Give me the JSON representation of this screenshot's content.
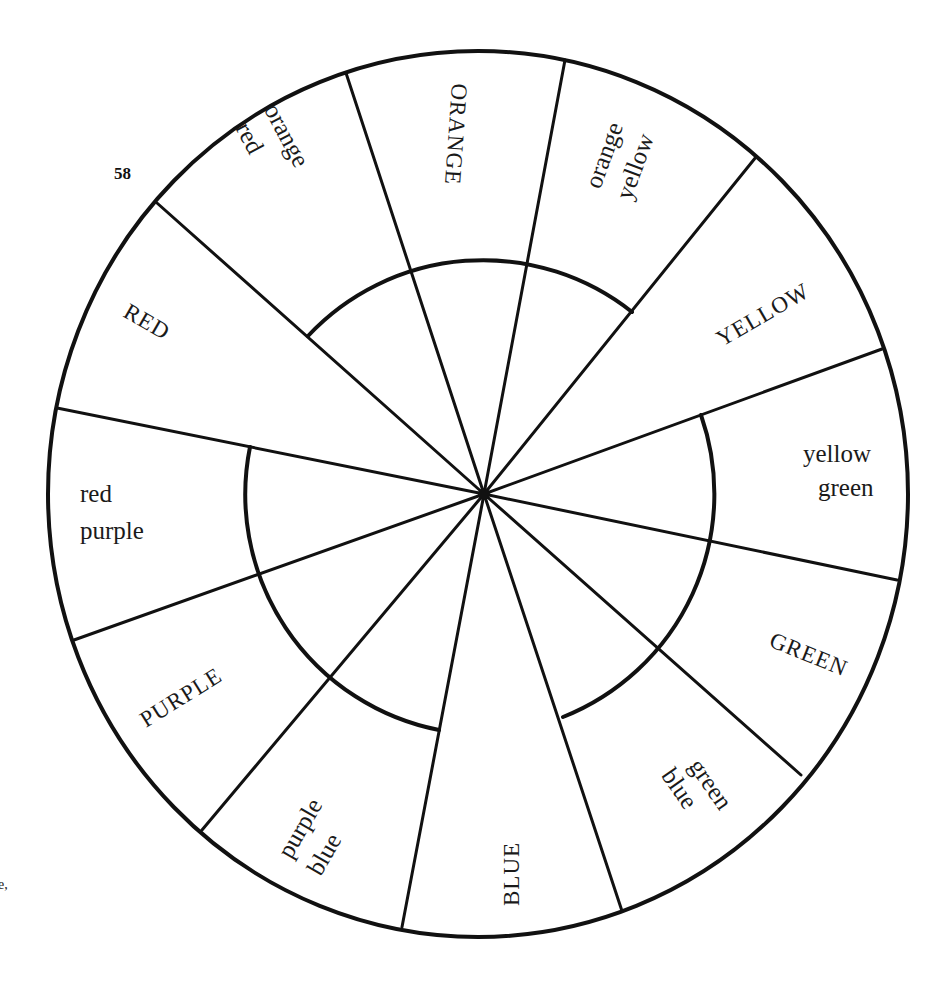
{
  "page": {
    "page_number": "58",
    "margin_mark": "e,"
  },
  "wheel": {
    "center": [
      484,
      494
    ],
    "outer_stroke_color": "#111111",
    "background_color": "#ffffff",
    "segments": [
      {
        "name": "orange",
        "line1": "ORANGE",
        "line2": ""
      },
      {
        "name": "orange-yellow",
        "line1": "orange",
        "line2": "yellow"
      },
      {
        "name": "yellow",
        "line1": "YELLOW",
        "line2": ""
      },
      {
        "name": "yellow-green",
        "line1": "yellow",
        "line2": "green"
      },
      {
        "name": "green",
        "line1": "GREEN",
        "line2": ""
      },
      {
        "name": "green-blue",
        "line1": "green",
        "line2": "blue"
      },
      {
        "name": "blue",
        "line1": "BLUE",
        "line2": ""
      },
      {
        "name": "purple-blue",
        "line1": "purple",
        "line2": "blue"
      },
      {
        "name": "purple",
        "line1": "PURPLE",
        "line2": ""
      },
      {
        "name": "red-purple",
        "line1": "red",
        "line2": "purple"
      },
      {
        "name": "red",
        "line1": "RED",
        "line2": ""
      },
      {
        "name": "orange-red",
        "line1": "orange",
        "line2": "red"
      }
    ]
  }
}
